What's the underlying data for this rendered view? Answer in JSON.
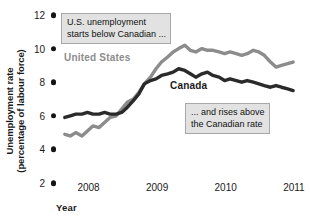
{
  "chart_data": {
    "type": "line",
    "title": "",
    "subtitle": "",
    "xlabel": "Year",
    "ylabel": "Unemployment rate\n(percentage of labour force)",
    "ylabel_line1": "Unemployment rate",
    "ylabel_line2": "(percentage of labour force)",
    "xlim": [
      2007.6,
      2011.1
    ],
    "ylim": [
      2,
      12
    ],
    "grid": false,
    "legend_position": "inline-series-labels",
    "yticks": [
      12,
      10,
      8,
      6,
      4,
      2
    ],
    "ytick_labels": [
      "12",
      "10",
      "8",
      "6",
      "4",
      "2"
    ],
    "xticks": [
      2008,
      2009,
      2010,
      2011
    ],
    "xtick_labels": [
      "2008",
      "2009",
      "2010",
      "2011"
    ],
    "series": [
      {
        "name": "United States",
        "color": "#8c8c8c",
        "label_color": "#8c8c8c",
        "x": [
          2007.67,
          2007.75,
          2007.83,
          2007.92,
          2008.0,
          2008.08,
          2008.17,
          2008.25,
          2008.33,
          2008.42,
          2008.5,
          2008.58,
          2008.67,
          2008.75,
          2008.83,
          2008.92,
          2009.0,
          2009.08,
          2009.17,
          2009.25,
          2009.33,
          2009.42,
          2009.5,
          2009.58,
          2009.67,
          2009.75,
          2009.83,
          2009.92,
          2010.0,
          2010.08,
          2010.17,
          2010.25,
          2010.33,
          2010.42,
          2010.5,
          2010.58,
          2010.67,
          2010.75,
          2010.83,
          2010.92,
          2011.0
        ],
        "values": [
          4.9,
          4.8,
          5.0,
          4.8,
          5.1,
          5.4,
          5.3,
          5.6,
          5.9,
          6.0,
          6.4,
          6.8,
          7.0,
          7.4,
          7.9,
          8.3,
          8.8,
          9.2,
          9.5,
          9.8,
          10.0,
          10.2,
          9.9,
          9.8,
          10.0,
          9.9,
          9.9,
          9.8,
          9.7,
          9.8,
          9.7,
          9.6,
          9.7,
          9.9,
          9.8,
          9.6,
          9.2,
          8.9,
          9.0,
          9.1,
          9.2
        ]
      },
      {
        "name": "Canada",
        "color": "#2a2a2a",
        "label_color": "#1a1a1a",
        "x": [
          2007.67,
          2007.75,
          2007.83,
          2007.92,
          2008.0,
          2008.08,
          2008.17,
          2008.25,
          2008.33,
          2008.42,
          2008.5,
          2008.58,
          2008.67,
          2008.75,
          2008.83,
          2008.92,
          2009.0,
          2009.08,
          2009.17,
          2009.25,
          2009.33,
          2009.42,
          2009.5,
          2009.58,
          2009.67,
          2009.75,
          2009.83,
          2009.92,
          2010.0,
          2010.08,
          2010.17,
          2010.25,
          2010.33,
          2010.42,
          2010.5,
          2010.58,
          2010.67,
          2010.75,
          2010.83,
          2010.92,
          2011.0
        ],
        "values": [
          5.9,
          6.0,
          6.1,
          6.1,
          6.2,
          6.1,
          6.1,
          6.2,
          6.1,
          6.1,
          6.2,
          6.5,
          6.9,
          7.3,
          7.9,
          8.1,
          8.2,
          8.4,
          8.5,
          8.6,
          8.8,
          8.7,
          8.5,
          8.3,
          8.5,
          8.6,
          8.4,
          8.3,
          8.1,
          8.2,
          8.1,
          8.0,
          8.1,
          8.0,
          7.9,
          7.8,
          7.7,
          7.8,
          7.7,
          7.6,
          7.5
        ]
      }
    ],
    "annotations": [
      {
        "id": "callout-1",
        "text_line1": "U.S. unemployment",
        "text_line2": "starts below Canadian ..."
      },
      {
        "id": "callout-2",
        "text_line1": "... and rises above",
        "text_line2": "the Canadian rate"
      }
    ]
  },
  "colors": {
    "united_states": "#8c8c8c",
    "canada": "#2a2a2a",
    "callout_fill": "#e2e2e2",
    "callout_border": "#a8a8a8",
    "tick": "#141414",
    "background": "#ffffff"
  }
}
